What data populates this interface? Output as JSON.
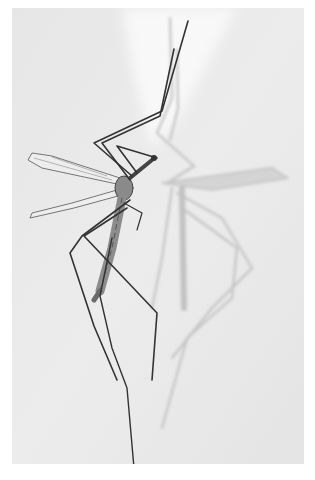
{
  "photo": {
    "subject": "crane fly",
    "description": "Black-and-white photograph of a crane fly resting on a pale surface, casting a soft shadow to its right",
    "colors": {
      "border": "#ffffff",
      "background": "#e9e9e9",
      "highlight": "#f7f7f7",
      "insect": "#3a3a3a",
      "shadow": "#c4c4c4"
    }
  }
}
